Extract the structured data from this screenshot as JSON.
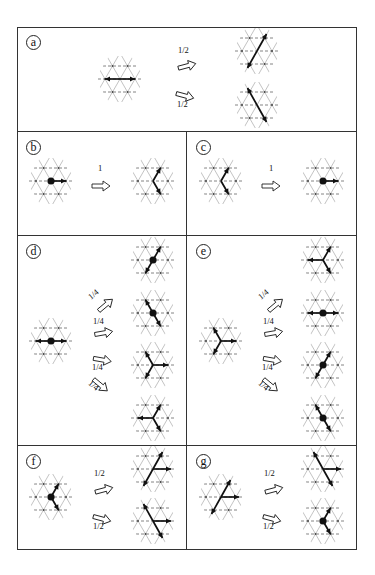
{
  "figure": {
    "border_color": "#333333",
    "lattice_line_color": "#9a9a9a",
    "arrow_color": "#111111"
  },
  "panels": [
    {
      "id": "a",
      "label": "a",
      "box": {
        "x": 17,
        "y": 27,
        "w": 340,
        "h": 104
      },
      "lattices": [
        {
          "x": 95,
          "y": 56,
          "dot": false,
          "rods": [
            [
              "W",
              1
            ],
            [
              "E",
              1
            ]
          ]
        },
        {
          "x": 232,
          "y": 28,
          "dot": false,
          "bar": "NE_thru_offset"
        },
        {
          "x": 232,
          "y": 82,
          "dot": false,
          "bar": "NW_thru_offset"
        }
      ],
      "arrows": [
        {
          "x": 177,
          "y": 57,
          "angle": -15,
          "prob": "1/2",
          "px": 178,
          "py": 46
        },
        {
          "x": 177,
          "y": 87,
          "angle": 15,
          "prob": "1/2",
          "px": 177,
          "py": 100
        }
      ]
    },
    {
      "id": "b",
      "label": "b",
      "box": {
        "x": 17,
        "y": 131,
        "w": 169,
        "h": 104
      },
      "lattices": [
        {
          "x": 26,
          "y": 158,
          "dot": true,
          "rods": [
            [
              "E",
              1
            ]
          ]
        },
        {
          "x": 128,
          "y": 158,
          "dot": false,
          "rods": [
            [
              "NE",
              1
            ],
            [
              "SE",
              1
            ]
          ]
        }
      ],
      "arrows": [
        {
          "x": 92,
          "y": 177,
          "angle": 0,
          "prob": "1",
          "px": 98,
          "py": 164
        }
      ]
    },
    {
      "id": "c",
      "label": "c",
      "box": {
        "x": 186,
        "y": 131,
        "w": 171,
        "h": 104
      },
      "lattices": [
        {
          "x": 196,
          "y": 158,
          "dot": false,
          "rods": [
            [
              "NE",
              1
            ],
            [
              "SE",
              1
            ]
          ]
        },
        {
          "x": 298,
          "y": 158,
          "dot": true,
          "rods": [
            [
              "E",
              1
            ]
          ]
        }
      ],
      "arrows": [
        {
          "x": 262,
          "y": 177,
          "angle": 0,
          "prob": "1",
          "px": 269,
          "py": 164
        }
      ]
    },
    {
      "id": "d",
      "label": "d",
      "box": {
        "x": 17,
        "y": 235,
        "w": 169,
        "h": 210
      },
      "lattices": [
        {
          "x": 26,
          "y": 318,
          "dot": true,
          "rods": [
            [
              "W",
              1
            ],
            [
              "E",
              1
            ]
          ]
        },
        {
          "x": 128,
          "y": 237,
          "dot": true,
          "rods": [
            [
              "NE",
              1
            ],
            [
              "SW",
              1
            ]
          ]
        },
        {
          "x": 128,
          "y": 290,
          "dot": true,
          "rods": [
            [
              "NW",
              1
            ],
            [
              "SE",
              1
            ]
          ]
        },
        {
          "x": 128,
          "y": 342,
          "dot": false,
          "rods": [
            [
              "NW",
              1
            ],
            [
              "SW",
              1
            ],
            [
              "E",
              1
            ]
          ]
        },
        {
          "x": 128,
          "y": 395,
          "dot": false,
          "rods": [
            [
              "NE",
              1
            ],
            [
              "SE",
              1
            ],
            [
              "W",
              1
            ]
          ]
        }
      ],
      "arrows": [
        {
          "x": 94,
          "y": 297,
          "angle": -40,
          "prob": "1/4",
          "px": 88,
          "py": 290,
          "rot": -40
        },
        {
          "x": 94,
          "y": 324,
          "angle": -10,
          "prob": "1/4",
          "px": 93,
          "py": 317,
          "rot": 0
        },
        {
          "x": 94,
          "y": 351,
          "angle": 10,
          "prob": "1/4",
          "px": 92,
          "py": 363,
          "rot": 0
        },
        {
          "x": 94,
          "y": 377,
          "angle": 40,
          "prob": "1/4",
          "px": 88,
          "py": 381,
          "rot": 40
        }
      ]
    },
    {
      "id": "e",
      "label": "e",
      "box": {
        "x": 186,
        "y": 235,
        "w": 171,
        "h": 210
      },
      "lattices": [
        {
          "x": 196,
          "y": 318,
          "dot": false,
          "rods": [
            [
              "NW",
              1
            ],
            [
              "SW",
              1
            ],
            [
              "E",
              1
            ]
          ]
        },
        {
          "x": 298,
          "y": 237,
          "dot": false,
          "rods": [
            [
              "NE",
              1
            ],
            [
              "SE",
              1
            ],
            [
              "W",
              1
            ]
          ]
        },
        {
          "x": 298,
          "y": 290,
          "dot": true,
          "rods": [
            [
              "W",
              1
            ],
            [
              "E",
              1
            ]
          ]
        },
        {
          "x": 298,
          "y": 342,
          "dot": true,
          "rods": [
            [
              "NE",
              1
            ],
            [
              "SW",
              1
            ]
          ]
        },
        {
          "x": 298,
          "y": 395,
          "dot": true,
          "rods": [
            [
              "NW",
              1
            ],
            [
              "SE",
              1
            ]
          ]
        }
      ],
      "arrows": [
        {
          "x": 264,
          "y": 297,
          "angle": -40,
          "prob": "1/4",
          "px": 258,
          "py": 290,
          "rot": -40
        },
        {
          "x": 264,
          "y": 324,
          "angle": -10,
          "prob": "1/4",
          "px": 263,
          "py": 317,
          "rot": 0
        },
        {
          "x": 264,
          "y": 351,
          "angle": 10,
          "prob": "1/4",
          "px": 262,
          "py": 363,
          "rot": 0
        },
        {
          "x": 264,
          "y": 377,
          "angle": 40,
          "prob": "1/4",
          "px": 258,
          "py": 381,
          "rot": 40
        }
      ]
    },
    {
      "id": "f",
      "label": "f",
      "box": {
        "x": 17,
        "y": 445,
        "w": 169,
        "h": 105
      },
      "lattices": [
        {
          "x": 26,
          "y": 474,
          "dot": true,
          "rods": [
            [
              "NE",
              1
            ],
            [
              "SE",
              1
            ]
          ]
        },
        {
          "x": 128,
          "y": 446,
          "dot": false,
          "bar": "NE_thru_offset_E"
        },
        {
          "x": 128,
          "y": 498,
          "dot": false,
          "bar": "NW_thru_offset_E"
        }
      ],
      "arrows": [
        {
          "x": 94,
          "y": 481,
          "angle": -15,
          "prob": "1/2",
          "px": 94,
          "py": 469
        },
        {
          "x": 94,
          "y": 510,
          "angle": 15,
          "prob": "1/2",
          "px": 93,
          "py": 522
        }
      ]
    },
    {
      "id": "g",
      "label": "g",
      "box": {
        "x": 186,
        "y": 445,
        "w": 171,
        "h": 105
      },
      "lattices": [
        {
          "x": 196,
          "y": 474,
          "dot": false,
          "bar": "NE_thru_offset_E"
        },
        {
          "x": 298,
          "y": 446,
          "dot": false,
          "bar": "NW_thru_offset_E"
        },
        {
          "x": 298,
          "y": 498,
          "dot": true,
          "rods": [
            [
              "NE",
              1
            ],
            [
              "SE",
              1
            ]
          ]
        }
      ],
      "arrows": [
        {
          "x": 264,
          "y": 481,
          "angle": -15,
          "prob": "1/2",
          "px": 264,
          "py": 469
        },
        {
          "x": 264,
          "y": 510,
          "angle": 15,
          "prob": "1/2",
          "px": 263,
          "py": 522
        }
      ]
    }
  ]
}
